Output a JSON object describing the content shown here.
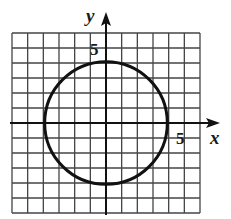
{
  "figure": {
    "type": "coordinate-grid-with-circle",
    "axis_labels": {
      "x": "x",
      "y": "y"
    },
    "tick_labels": {
      "x_tick": "5",
      "y_tick": "5"
    },
    "grid": {
      "x_min": -6,
      "x_max": 6,
      "y_min": -6,
      "y_max": 6,
      "step": 1
    },
    "circle": {
      "center": [
        0,
        0
      ],
      "radius": 4
    },
    "colors": {
      "grid": "#444444",
      "axes": "#111111",
      "circle": "#111111",
      "background": "#ffffff"
    }
  }
}
